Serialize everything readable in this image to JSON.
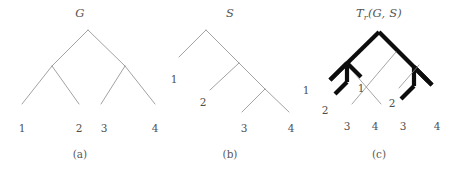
{
  "figure": {
    "background_color": "#ffffff",
    "line_color_thin": "#8a8a8a",
    "line_color_bold": "#0d0d0d"
  },
  "panels": [
    {
      "id": "a",
      "caption": "(a)",
      "title_main": "G",
      "title_sub": "",
      "title_tail": "",
      "description": "gene tree",
      "leaf_labels": [
        "1",
        "2",
        "3",
        "4"
      ],
      "internal_labels": []
    },
    {
      "id": "b",
      "caption": "(b)",
      "title_main": "S",
      "title_sub": "",
      "title_tail": "",
      "description": "species tree",
      "leaf_labels": [
        "1",
        "2",
        "3",
        "4"
      ],
      "internal_labels": []
    },
    {
      "id": "c",
      "caption": "(c)",
      "title_main": "T",
      "title_sub": "r",
      "title_tail": "(G, S)",
      "description": "reconciliation of gene tree into species tree",
      "leaf_labels": [
        "1",
        "2",
        "3",
        "4",
        "1",
        "2",
        "3",
        "4"
      ],
      "internal_labels": []
    }
  ],
  "panel_a": {
    "title_main": "G",
    "caption": "(a)",
    "leaves": [
      {
        "name": "leaf-1",
        "label": "1",
        "x": 22,
        "y": 128
      },
      {
        "name": "leaf-2",
        "label": "2",
        "x": 76,
        "y": 128
      },
      {
        "name": "leaf-3",
        "label": "3",
        "x": 104,
        "y": 128
      },
      {
        "name": "leaf-4",
        "label": "4",
        "x": 154,
        "y": 128
      }
    ]
  },
  "panel_b": {
    "title_main": "S",
    "caption": "(b)",
    "leaves": [
      {
        "name": "leaf-1",
        "label": "1",
        "x": 19,
        "y": 79
      },
      {
        "name": "leaf-2",
        "label": "2",
        "x": 48,
        "y": 101
      },
      {
        "name": "leaf-3",
        "label": "3",
        "x": 89,
        "y": 128
      },
      {
        "name": "leaf-4",
        "label": "4",
        "x": 136,
        "y": 128
      }
    ]
  },
  "panel_c": {
    "title_main": "T",
    "title_sub": "r",
    "title_tail": "(G, S)",
    "caption": "(c)",
    "leaves": [
      {
        "name": "leaf-left-1",
        "label": "1",
        "x": 11,
        "y": 90
      },
      {
        "name": "leaf-left-2",
        "label": "2",
        "x": 30,
        "y": 110
      },
      {
        "name": "leaf-mid-1",
        "label": "1",
        "x": 66,
        "y": 88
      },
      {
        "name": "leaf-mid-2",
        "label": "2",
        "x": 97,
        "y": 103
      },
      {
        "name": "leaf-bottom-3a",
        "label": "3",
        "x": 52,
        "y": 126
      },
      {
        "name": "leaf-bottom-4a",
        "label": "4",
        "x": 80,
        "y": 126
      },
      {
        "name": "leaf-bottom-3b",
        "label": "3",
        "x": 108,
        "y": 126
      },
      {
        "name": "leaf-bottom-4b",
        "label": "4",
        "x": 142,
        "y": 126
      }
    ]
  }
}
